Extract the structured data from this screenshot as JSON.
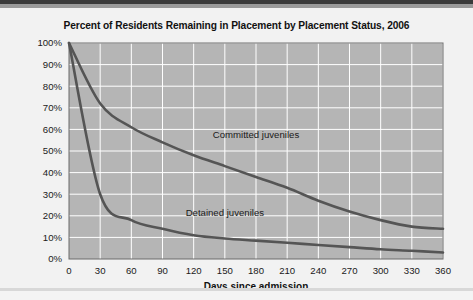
{
  "chart_data": {
    "type": "line",
    "title": "Percent of Residents Remaining in Placement by Placement Status, 2006",
    "xlabel": "Days since admission",
    "ylabel": "",
    "x": [
      0,
      30,
      60,
      90,
      120,
      150,
      180,
      210,
      240,
      270,
      300,
      330,
      360
    ],
    "xticklabels": [
      "0",
      "30",
      "60",
      "90",
      "120",
      "150",
      "180",
      "210",
      "240",
      "270",
      "300",
      "330",
      "360"
    ],
    "yticklabels": [
      "0%",
      "10%",
      "20%",
      "30%",
      "40%",
      "50%",
      "60%",
      "70%",
      "80%",
      "90%",
      "100%"
    ],
    "yticks": [
      0,
      10,
      20,
      30,
      40,
      50,
      60,
      70,
      80,
      90,
      100
    ],
    "xlim": [
      0,
      360
    ],
    "ylim": [
      0,
      100
    ],
    "grid": true,
    "legend_position": "inline-annotation",
    "series": [
      {
        "name": "Committed juveniles",
        "label": "Committed juveniles",
        "color": "#555555",
        "values": [
          100,
          72,
          61,
          54,
          48,
          43,
          38,
          33,
          27,
          22,
          18,
          15,
          14
        ],
        "label_x": 180,
        "label_y": 56
      },
      {
        "name": "Detained juveniles",
        "label": "Detained juveniles",
        "color": "#555555",
        "values": [
          100,
          30,
          18,
          14,
          11,
          9.5,
          8.5,
          7.5,
          6.5,
          5.5,
          4.5,
          3.8,
          3
        ],
        "label_x": 150,
        "label_y": 20
      }
    ],
    "plot_background": "#b5b5b5",
    "grid_color": "#ffffff",
    "figure_background": "#f2f2f2"
  }
}
